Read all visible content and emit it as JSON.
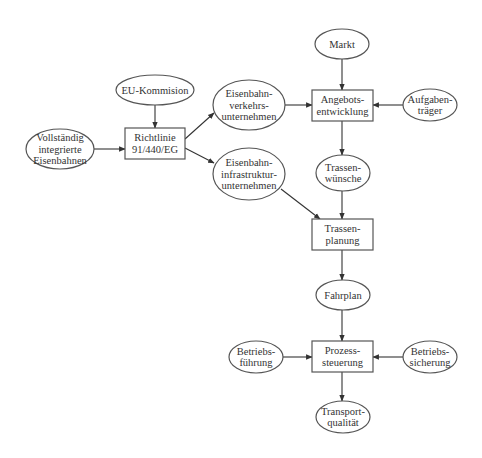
{
  "diagram": {
    "type": "flowchart",
    "colors": {
      "stroke": "#555555",
      "text": "#333333",
      "background": "#ffffff"
    },
    "nodes": [
      {
        "id": "markt",
        "shape": "ellipse",
        "cx": 342,
        "cy": 44,
        "rx": 27,
        "ry": 15,
        "lines": [
          "Markt"
        ]
      },
      {
        "id": "angebot",
        "shape": "rect",
        "x": 312,
        "y": 90,
        "w": 61,
        "h": 31,
        "lines": [
          "Angebots-",
          "entwicklung"
        ]
      },
      {
        "id": "aufgaben",
        "shape": "ellipse",
        "cx": 430,
        "cy": 105,
        "rx": 27,
        "ry": 16,
        "lines": [
          "Aufgaben-",
          "träger"
        ]
      },
      {
        "id": "eu",
        "shape": "ellipse",
        "cx": 155,
        "cy": 90,
        "rx": 39,
        "ry": 15,
        "lines": [
          "EU-Kommision"
        ]
      },
      {
        "id": "evu",
        "shape": "ellipse",
        "cx": 249,
        "cy": 105,
        "rx": 36,
        "ry": 25,
        "lines": [
          "Eisenbahn-",
          "verkehrs-",
          "unternehmen"
        ]
      },
      {
        "id": "vollst",
        "shape": "ellipse",
        "cx": 60,
        "cy": 149,
        "rx": 34,
        "ry": 20,
        "lines": [
          "Vollständig",
          "integrierte",
          "Eisenbahnen"
        ]
      },
      {
        "id": "richtlinie",
        "shape": "rect",
        "x": 125,
        "y": 128,
        "w": 60,
        "h": 31,
        "lines": [
          "Richtlinie",
          "91/440/EG"
        ]
      },
      {
        "id": "eiu",
        "shape": "ellipse",
        "cx": 249,
        "cy": 174,
        "rx": 36,
        "ry": 26,
        "lines": [
          "Eisenbahn-",
          "infrastruktur-",
          "unternehmen"
        ]
      },
      {
        "id": "wuensche",
        "shape": "ellipse",
        "cx": 343,
        "cy": 173,
        "rx": 27,
        "ry": 18,
        "lines": [
          "Trassen-",
          "wünsche"
        ]
      },
      {
        "id": "planung",
        "shape": "rect",
        "x": 312,
        "y": 219,
        "w": 61,
        "h": 31,
        "lines": [
          "Trassen-",
          "planung"
        ]
      },
      {
        "id": "fahrplan",
        "shape": "ellipse",
        "cx": 343,
        "cy": 295,
        "rx": 27,
        "ry": 15,
        "lines": [
          "Fahrplan"
        ]
      },
      {
        "id": "prozess",
        "shape": "rect",
        "x": 312,
        "y": 341,
        "w": 61,
        "h": 31,
        "lines": [
          "Prozess-",
          "steuerung"
        ]
      },
      {
        "id": "bfuehrung",
        "shape": "ellipse",
        "cx": 256,
        "cy": 357,
        "rx": 27,
        "ry": 16,
        "lines": [
          "Betriebs-",
          "führung"
        ]
      },
      {
        "id": "bsicherung",
        "shape": "ellipse",
        "cx": 430,
        "cy": 357,
        "rx": 27,
        "ry": 16,
        "lines": [
          "Betriebs-",
          "sicherung"
        ]
      },
      {
        "id": "transport",
        "shape": "ellipse",
        "cx": 343,
        "cy": 417,
        "rx": 27,
        "ry": 16,
        "lines": [
          "Transport-",
          "qualität"
        ]
      }
    ],
    "edges": [
      {
        "from": "markt",
        "to": "angebot",
        "x1": 342,
        "y1": 59,
        "x2": 342,
        "y2": 90
      },
      {
        "from": "aufgaben",
        "to": "angebot",
        "x1": 403,
        "y1": 105,
        "x2": 373,
        "y2": 105
      },
      {
        "from": "evu",
        "to": "angebot",
        "x1": 285,
        "y1": 105,
        "x2": 312,
        "y2": 105
      },
      {
        "from": "eu",
        "to": "richtlinie",
        "x1": 155,
        "y1": 105,
        "x2": 155,
        "y2": 128
      },
      {
        "from": "vollst",
        "to": "richtlinie",
        "x1": 94,
        "y1": 149,
        "x2": 125,
        "y2": 149
      },
      {
        "from": "richtlinie",
        "to": "evu",
        "x1": 185,
        "y1": 139,
        "x2": 214,
        "y2": 113
      },
      {
        "from": "richtlinie",
        "to": "eiu",
        "x1": 185,
        "y1": 148,
        "x2": 214,
        "y2": 163
      },
      {
        "from": "angebot",
        "to": "wuensche",
        "x1": 342,
        "y1": 121,
        "x2": 342,
        "y2": 155
      },
      {
        "from": "wuensche",
        "to": "planung",
        "x1": 342,
        "y1": 191,
        "x2": 342,
        "y2": 219
      },
      {
        "from": "eiu",
        "to": "planung",
        "x1": 281,
        "y1": 189,
        "x2": 320,
        "y2": 219
      },
      {
        "from": "planung",
        "to": "fahrplan",
        "x1": 342,
        "y1": 250,
        "x2": 342,
        "y2": 280
      },
      {
        "from": "fahrplan",
        "to": "prozess",
        "x1": 342,
        "y1": 310,
        "x2": 342,
        "y2": 341
      },
      {
        "from": "bfuehrung",
        "to": "prozess",
        "x1": 283,
        "y1": 357,
        "x2": 312,
        "y2": 357
      },
      {
        "from": "bsicherung",
        "to": "prozess",
        "x1": 403,
        "y1": 357,
        "x2": 373,
        "y2": 357
      },
      {
        "from": "prozess",
        "to": "transport",
        "x1": 342,
        "y1": 372,
        "x2": 342,
        "y2": 401
      }
    ]
  }
}
